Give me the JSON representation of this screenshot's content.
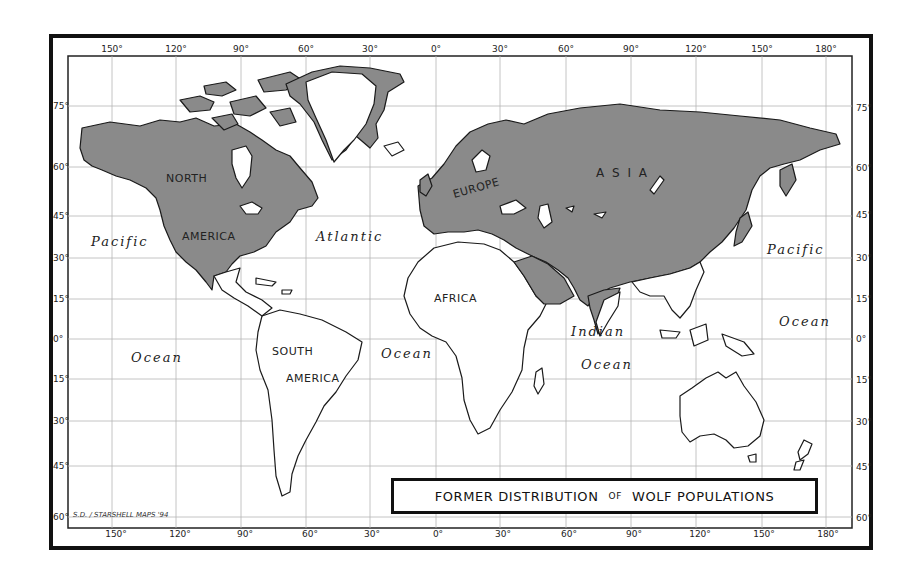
{
  "map": {
    "title": {
      "part1": "FORMER DISTRIBUTION",
      "part2": "OF",
      "part3": "WOLF POPULATIONS"
    },
    "credit": "S.D. / STARSHELL MAPS '94",
    "colors": {
      "wolf_range": "#8a8a8a",
      "land": "#ffffff",
      "outline": "#1a1a1a",
      "grid": "#b5b5b5",
      "frame": "#111111"
    },
    "longitude_ticks_top": [
      "150°",
      "120°",
      "90°",
      "60°",
      "30°",
      "0°",
      "30°",
      "60°",
      "90°",
      "120°",
      "150°",
      "180°"
    ],
    "longitude_ticks_bottom": [
      "150°",
      "120°",
      "90°",
      "60°",
      "30°",
      "0°",
      "30°",
      "60°",
      "90°",
      "120°",
      "150°",
      "180°"
    ],
    "latitude_ticks_left": [
      "75°",
      "60°",
      "45°",
      "30°",
      "15°",
      "0°",
      "15°",
      "30°",
      "45°",
      "60°"
    ],
    "latitude_ticks_right": [
      "75°",
      "60°",
      "45°",
      "30°",
      "15°",
      "0°",
      "15°",
      "30°",
      "45°",
      "60°"
    ],
    "continent_labels": {
      "north": "NORTH",
      "america_n": "AMERICA",
      "south": "SOUTH",
      "america_s": "AMERICA",
      "europe": "EUROPE",
      "asia": "A S I A",
      "africa": "AFRICA"
    },
    "ocean_labels": {
      "pacific_w": "Pacific",
      "ocean_w": "Ocean",
      "atlantic": "Atlantic",
      "ocean_atl": "Ocean",
      "indian": "Indian",
      "ocean_ind": "Ocean",
      "pacific_e": "Pacific",
      "ocean_e": "Ocean"
    },
    "legend": {
      "shaded_meaning": "Former wolf range (shaded gray)"
    }
  }
}
